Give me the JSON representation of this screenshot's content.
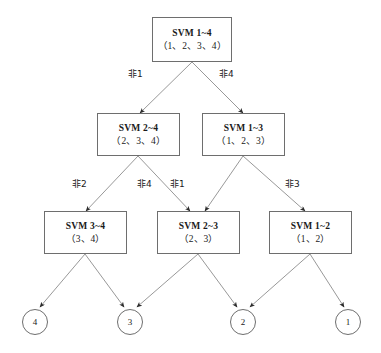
{
  "diagram": {
    "stroke_color": "#8c8c8c",
    "arrow_color": "#2b2b2b",
    "box_border_color": "#6e6e6e",
    "text_color": "#1a1a1a",
    "background_color": "#ffffff"
  },
  "nodes": [
    {
      "id": "svm14",
      "title": "SVM 1~4",
      "set": "（1、2、3、4）",
      "x": 152,
      "y": 17,
      "w": 80,
      "h": 45
    },
    {
      "id": "svm24",
      "title": "SVM 2~4",
      "set": "（2、3、4）",
      "x": 97,
      "y": 113,
      "w": 83,
      "h": 43
    },
    {
      "id": "svm13",
      "title": "SVM 1~3",
      "set": "（1、2、3）",
      "x": 202,
      "y": 113,
      "w": 83,
      "h": 43
    },
    {
      "id": "svm34",
      "title": "SVM 3~4",
      "set": "（3、4）",
      "x": 44,
      "y": 211,
      "w": 83,
      "h": 43
    },
    {
      "id": "svm23",
      "title": "SVM 2~3",
      "set": "（2、3）",
      "x": 157,
      "y": 211,
      "w": 83,
      "h": 43
    },
    {
      "id": "svm12",
      "title": "SVM 1~2",
      "set": "（1、2）",
      "x": 269,
      "y": 211,
      "w": 83,
      "h": 43
    }
  ],
  "leaves": [
    {
      "id": "leaf4",
      "label": "4",
      "cx": 35,
      "cy": 322,
      "r": 13
    },
    {
      "id": "leaf3",
      "label": "3",
      "cx": 130,
      "cy": 322,
      "r": 13
    },
    {
      "id": "leaf2",
      "label": "2",
      "cx": 243,
      "cy": 322,
      "r": 13
    },
    {
      "id": "leaf1",
      "label": "1",
      "cx": 348,
      "cy": 322,
      "r": 13
    }
  ],
  "edge_labels": [
    {
      "id": "e-not1-top",
      "text": "非1",
      "x": 128,
      "y": 70
    },
    {
      "id": "e-not4-top",
      "text": "非4",
      "x": 219,
      "y": 70
    },
    {
      "id": "e-not2-mid",
      "text": "非2",
      "x": 72,
      "y": 180
    },
    {
      "id": "e-not4-mid",
      "text": "非4",
      "x": 137,
      "y": 180
    },
    {
      "id": "e-not1-mid",
      "text": "非1",
      "x": 170,
      "y": 180
    },
    {
      "id": "e-not3-mid",
      "text": "非3",
      "x": 285,
      "y": 180
    }
  ],
  "edges": [
    {
      "id": "svm14-to-svm24",
      "from": "svm14",
      "to": "svm24",
      "label": "非1",
      "x1": 192,
      "y1": 62,
      "x2": 140,
      "y2": 113
    },
    {
      "id": "svm14-to-svm13",
      "from": "svm14",
      "to": "svm13",
      "label": "非4",
      "x1": 192,
      "y1": 62,
      "x2": 243,
      "y2": 113
    },
    {
      "id": "svm24-to-svm34",
      "from": "svm24",
      "to": "svm34",
      "label": "非2",
      "x1": 138,
      "y1": 156,
      "x2": 86,
      "y2": 211
    },
    {
      "id": "svm24-to-svm23",
      "from": "svm24",
      "to": "svm23",
      "label": "非4",
      "x1": 138,
      "y1": 156,
      "x2": 190,
      "y2": 211
    },
    {
      "id": "svm13-to-svm23",
      "from": "svm13",
      "to": "svm23",
      "label": "非1",
      "x1": 243,
      "y1": 156,
      "x2": 205,
      "y2": 211
    },
    {
      "id": "svm13-to-svm12",
      "from": "svm13",
      "to": "svm12",
      "label": "非3",
      "x1": 243,
      "y1": 156,
      "x2": 305,
      "y2": 211
    },
    {
      "id": "svm34-to-leaf4",
      "from": "svm34",
      "to": "leaf4",
      "label": "",
      "x1": 85,
      "y1": 254,
      "x2": 40,
      "y2": 307
    },
    {
      "id": "svm34-to-leaf3",
      "from": "svm34",
      "to": "leaf3",
      "label": "",
      "x1": 85,
      "y1": 254,
      "x2": 124,
      "y2": 307
    },
    {
      "id": "svm23-to-leaf3",
      "from": "svm23",
      "to": "leaf3",
      "label": "",
      "x1": 198,
      "y1": 254,
      "x2": 137,
      "y2": 307
    },
    {
      "id": "svm23-to-leaf2",
      "from": "svm23",
      "to": "leaf2",
      "label": "",
      "x1": 198,
      "y1": 254,
      "x2": 237,
      "y2": 307
    },
    {
      "id": "svm12-to-leaf2",
      "from": "svm12",
      "to": "leaf2",
      "label": "",
      "x1": 310,
      "y1": 254,
      "x2": 250,
      "y2": 307
    },
    {
      "id": "svm12-to-leaf1",
      "from": "svm12",
      "to": "leaf1",
      "label": "",
      "x1": 310,
      "y1": 254,
      "x2": 344,
      "y2": 307
    }
  ]
}
